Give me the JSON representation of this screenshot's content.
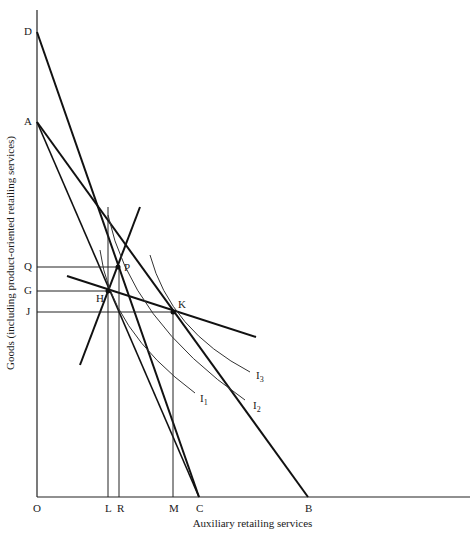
{
  "diagram": {
    "x_axis_label": "Auxiliary retailing services",
    "y_axis_label": "Goods (including product-oriented retailing services)",
    "axis_labels": {
      "origin": "O",
      "y_points": [
        "D",
        "A",
        "Q",
        "G",
        "J"
      ],
      "x_points": [
        "L",
        "R",
        "M",
        "C",
        "B"
      ]
    },
    "points": {
      "P": "P",
      "H": "H",
      "K": "K"
    },
    "curves": {
      "I1": {
        "base": "I",
        "sub": "1"
      },
      "I2": {
        "base": "I",
        "sub": "2"
      },
      "I3": {
        "base": "I",
        "sub": "3"
      }
    },
    "budget_lines": [
      "DC",
      "AC",
      "AB"
    ],
    "price_lines": [
      "line through H and P",
      "line through H and K"
    ]
  }
}
